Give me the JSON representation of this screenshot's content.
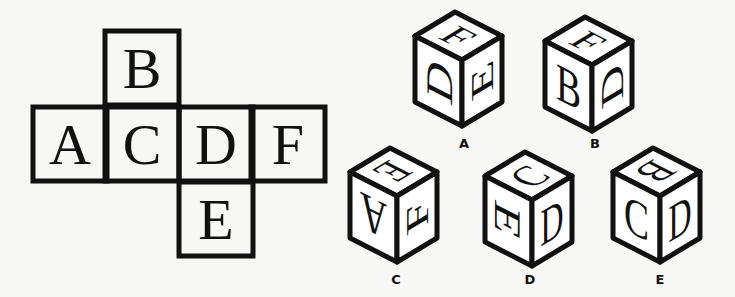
{
  "net": {
    "cells": [
      {
        "id": "B",
        "letter": "B",
        "x": 105,
        "y": 31
      },
      {
        "id": "A",
        "letter": "A",
        "x": 33,
        "y": 107
      },
      {
        "id": "C",
        "letter": "C",
        "x": 105,
        "y": 107
      },
      {
        "id": "D",
        "letter": "D",
        "x": 179,
        "y": 107
      },
      {
        "id": "F",
        "letter": "F",
        "x": 251,
        "y": 107
      },
      {
        "id": "E",
        "letter": "E",
        "x": 179,
        "y": 182
      }
    ],
    "cell_size": 74
  },
  "options": [
    {
      "label": "A",
      "center": [
        462,
        60
      ],
      "faces": {
        "top": {
          "letter": "F",
          "rot": 90
        },
        "left": {
          "letter": "D",
          "rot": -90
        },
        "right": {
          "letter": "E",
          "rot": -90
        }
      },
      "label_pos": [
        464,
        148
      ]
    },
    {
      "label": "B",
      "center": [
        592,
        65
      ],
      "faces": {
        "top": {
          "letter": "F",
          "rot": 90
        },
        "left": {
          "letter": "B",
          "rot": 0
        },
        "right": {
          "letter": "D",
          "rot": -90
        }
      },
      "label_pos": [
        595,
        148
      ]
    },
    {
      "label": "C",
      "center": [
        397,
        196
      ],
      "faces": {
        "top": {
          "letter": "E",
          "rot": 180
        },
        "left": {
          "letter": "A",
          "rot": 180
        },
        "right": {
          "letter": "F",
          "rot": -90
        }
      },
      "label_pos": [
        396,
        284
      ]
    },
    {
      "label": "D",
      "center": [
        532,
        200
      ],
      "faces": {
        "top": {
          "letter": "C",
          "rot": 0
        },
        "left": {
          "letter": "E",
          "rot": 90
        },
        "right": {
          "letter": "D",
          "rot": 0
        }
      },
      "label_pos": [
        530,
        284
      ]
    },
    {
      "label": "E",
      "center": [
        660,
        196
      ],
      "faces": {
        "top": {
          "letter": "B",
          "rot": 180
        },
        "left": {
          "letter": "C",
          "rot": 0
        },
        "right": {
          "letter": "D",
          "rot": 0
        }
      },
      "label_pos": [
        660,
        284
      ]
    }
  ]
}
